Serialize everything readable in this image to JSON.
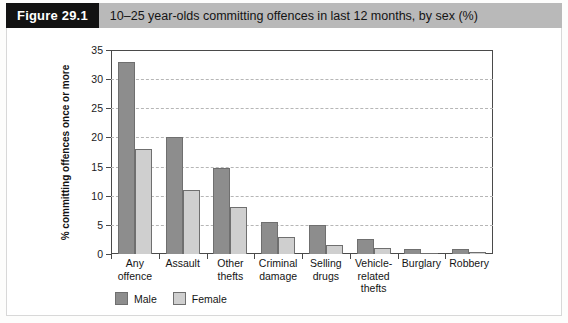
{
  "header": {
    "figure_tag": "Figure 29.1",
    "caption": "10–25 year-olds committing offences in last 12 months, by sex (%)"
  },
  "chart_data": {
    "type": "bar",
    "title": "10–25 year-olds committing offences in last 12 months, by sex (%)",
    "xlabel": "",
    "ylabel": "% committing offences once or more",
    "ylim": [
      0,
      35
    ],
    "yticks": [
      0,
      5,
      10,
      15,
      20,
      25,
      30,
      35
    ],
    "ytick_labels": [
      "0",
      "5",
      "10",
      "15",
      "20",
      "25",
      "30",
      "35"
    ],
    "grid": true,
    "legend_position": "bottom-left",
    "categories": [
      "Any offence",
      "Assault",
      "Other thefts",
      "Criminal damage",
      "Selling drugs",
      "Vehicle-related thefts",
      "Burglary",
      "Robbery"
    ],
    "series": [
      {
        "name": "Male",
        "color": "#8d8d8d",
        "values": [
          33,
          20,
          14.8,
          5.5,
          5,
          2.5,
          0.8,
          0.8
        ]
      },
      {
        "name": "Female",
        "color": "#cfcfcf",
        "values": [
          18,
          11,
          8,
          3,
          1.5,
          1,
          0.2,
          0.3
        ]
      }
    ]
  }
}
